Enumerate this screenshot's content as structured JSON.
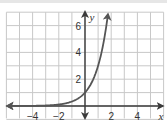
{
  "chart_data": {
    "type": "line",
    "title": "",
    "xlabel": "x",
    "ylabel": "y",
    "xlim": [
      -6,
      6
    ],
    "ylim": [
      -1,
      7
    ],
    "grid": true,
    "x_ticks": [
      -4,
      -2,
      2,
      4
    ],
    "y_ticks": [
      2,
      4,
      6
    ],
    "x_tick_labels": [
      "−4",
      "−2",
      "2",
      "4"
    ],
    "y_tick_labels": [
      "2",
      "4",
      "6"
    ],
    "series": [
      {
        "name": "y = 3^x",
        "x": [
          -6,
          -4,
          -3,
          -2,
          -1,
          0,
          0.5,
          1,
          1.5,
          1.77
        ],
        "y": [
          0.001,
          0.012,
          0.037,
          0.111,
          0.333,
          1,
          1.73,
          3,
          5.2,
          7
        ],
        "color": "#555555"
      }
    ],
    "annotations": [
      "passes through (0, 1)",
      "horizontal asymptote y = 0"
    ]
  },
  "colors": {
    "grid": "#c8c8c8",
    "axis": "#3a3a3a",
    "curve": "#555555",
    "text": "#333333"
  }
}
